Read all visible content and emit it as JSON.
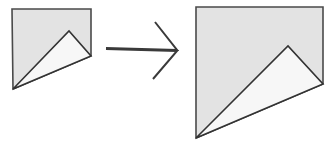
{
  "figure": {
    "background_color": "#ffffff",
    "width": 332,
    "height": 150,
    "colors": {
      "quad_fill": "#e3e3e3",
      "quad_stroke": "#4a4a4a",
      "triangle_fill": "#f7f7f7",
      "triangle_stroke": "#333333",
      "arrow_stroke": "#3a3a3a"
    },
    "shapes": [
      {
        "id": "left-shape",
        "name": "source-figure",
        "label": "",
        "quad_points": "12,9 91,9 91,56 13,89",
        "triangle_points": "13,89 69,31 91,56",
        "quad_vertices": [
          [
            12,
            9
          ],
          [
            91,
            9
          ],
          [
            91,
            56
          ],
          [
            13,
            89
          ]
        ],
        "triangle_vertices": [
          [
            13,
            89
          ],
          [
            69,
            31
          ],
          [
            91,
            56
          ]
        ]
      },
      {
        "id": "right-shape",
        "name": "transformed-figure",
        "label": "",
        "quad_points": "196,7 323,7 323,84 196,138",
        "triangle_points": "196,138 288,46 323,84",
        "quad_vertices": [
          [
            196,
            7
          ],
          [
            323,
            7
          ],
          [
            323,
            84
          ],
          [
            196,
            138
          ]
        ],
        "triangle_vertices": [
          [
            196,
            138
          ],
          [
            288,
            46
          ],
          [
            323,
            84
          ]
        ]
      }
    ],
    "arrow": {
      "id": "transform-arrow",
      "glyph": "double-right-arrow",
      "label": "",
      "upper_path": "106,48 177,50 155,22",
      "lower_path": "106,49 177,51 153,79",
      "tail_point": [
        106,
        48
      ],
      "apex_point": [
        177,
        50
      ],
      "upper_tip": [
        155,
        22
      ],
      "lower_tip": [
        153,
        79
      ]
    }
  }
}
